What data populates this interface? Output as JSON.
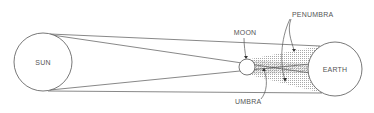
{
  "diagram": {
    "type": "solar-eclipse-shadow-geometry",
    "bodies": {
      "sun": {
        "label": "SUN",
        "cx": 43,
        "cy": 62,
        "r": 29
      },
      "moon": {
        "label": "MOON",
        "cx": 247,
        "cy": 67,
        "r": 8
      },
      "earth": {
        "label": "EARTH",
        "cx": 335,
        "cy": 69,
        "r": 27
      }
    },
    "labels": {
      "penumbra": "PENUMBRA",
      "umbra": "UMBRA"
    },
    "colors": {
      "stroke": "#555555",
      "text": "#555555",
      "background": "#ffffff",
      "shading": "#999999"
    }
  }
}
